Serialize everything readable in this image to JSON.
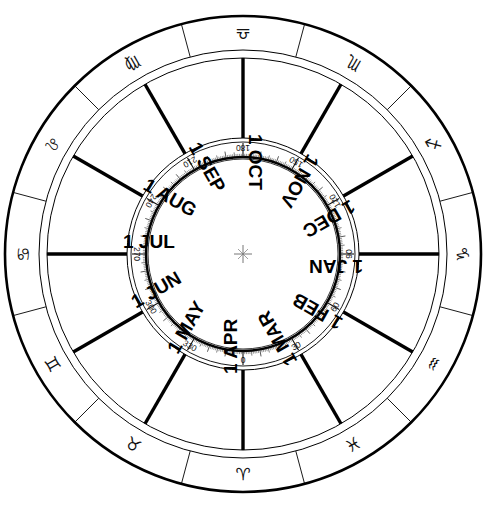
{
  "diagram": {
    "type": "volvelle",
    "center_mark": "crosshair-star",
    "colors": {
      "ink": "#000000",
      "background": "#ffffff",
      "scale_ink": "#111111"
    }
  },
  "outer_ring": {
    "name": "zodiac-ring",
    "segment_count": 12,
    "segments": [
      {
        "glyph": "♎",
        "name": "libra-glyph",
        "angle_deg": 0
      },
      {
        "glyph": "♏",
        "name": "scorpio-glyph",
        "angle_deg": 30
      },
      {
        "glyph": "♐",
        "name": "sagittarius-glyph",
        "angle_deg": 60
      },
      {
        "glyph": "♑",
        "name": "capricorn-glyph",
        "angle_deg": 90
      },
      {
        "glyph": "♒",
        "name": "aquarius-glyph",
        "angle_deg": 120
      },
      {
        "glyph": "♓",
        "name": "pisces-glyph",
        "angle_deg": 150
      },
      {
        "glyph": "♈",
        "name": "aries-glyph",
        "angle_deg": 180
      },
      {
        "glyph": "♉",
        "name": "taurus-glyph",
        "angle_deg": 210
      },
      {
        "glyph": "♊",
        "name": "gemini-glyph",
        "angle_deg": 240
      },
      {
        "glyph": "♋",
        "name": "cancer-glyph",
        "angle_deg": 270
      },
      {
        "glyph": "♌",
        "name": "leo-glyph",
        "angle_deg": 300
      },
      {
        "glyph": "♍",
        "name": "virgo-glyph",
        "angle_deg": 330
      }
    ]
  },
  "month_ring": {
    "name": "month-ring",
    "segment_count": 12,
    "labels": [
      {
        "text": "1 OCT",
        "angle_deg": 0
      },
      {
        "text": "1 NOV",
        "angle_deg": 30
      },
      {
        "text": "1 DEC",
        "angle_deg": 60
      },
      {
        "text": "1 JAN",
        "angle_deg": 90
      },
      {
        "text": "1 FEB",
        "angle_deg": 120
      },
      {
        "text": "1 MAR",
        "angle_deg": 150
      },
      {
        "text": "1 APR",
        "angle_deg": 180
      },
      {
        "text": "1 MAY",
        "angle_deg": 210
      },
      {
        "text": "1 JUN",
        "angle_deg": 240
      },
      {
        "text": "1 JUL",
        "angle_deg": 270
      },
      {
        "text": "1 AUG",
        "angle_deg": 300
      },
      {
        "text": "1 SEP",
        "angle_deg": 330
      }
    ]
  },
  "degree_ring": {
    "name": "degree-scale-ring",
    "units": "degrees",
    "range": [
      0,
      360
    ],
    "major_step": 30,
    "minor_step": 1,
    "zero_position": "bottom",
    "direction": "counter-clockwise",
    "labels": [
      {
        "text": "0",
        "value": 0
      },
      {
        "text": "30",
        "value": 30
      },
      {
        "text": "60",
        "value": 60
      },
      {
        "text": "90",
        "value": 90
      },
      {
        "text": "120",
        "value": 120
      },
      {
        "text": "150",
        "value": 150
      },
      {
        "text": "180",
        "value": 180
      },
      {
        "text": "210",
        "value": 210
      },
      {
        "text": "240",
        "value": 240
      },
      {
        "text": "270",
        "value": 270
      },
      {
        "text": "300",
        "value": 300
      },
      {
        "text": "330",
        "value": 330
      }
    ]
  },
  "chart_data": {
    "type": "pie",
    "categories": [
      "1 OCT",
      "1 NOV",
      "1 DEC",
      "1 JAN",
      "1 FEB",
      "1 MAR",
      "1 APR",
      "1 MAY",
      "1 JUN",
      "1 JUL",
      "1 AUG",
      "1 SEP"
    ],
    "values": [
      30,
      30,
      30,
      30,
      30,
      30,
      30,
      30,
      30,
      30,
      30,
      30
    ],
    "legend": [
      "♎",
      "♏",
      "♐",
      "♑",
      "♒",
      "♓",
      "♈",
      "♉",
      "♊",
      "♋",
      "♌",
      "♍"
    ],
    "xlabel": "",
    "ylabel": ""
  }
}
